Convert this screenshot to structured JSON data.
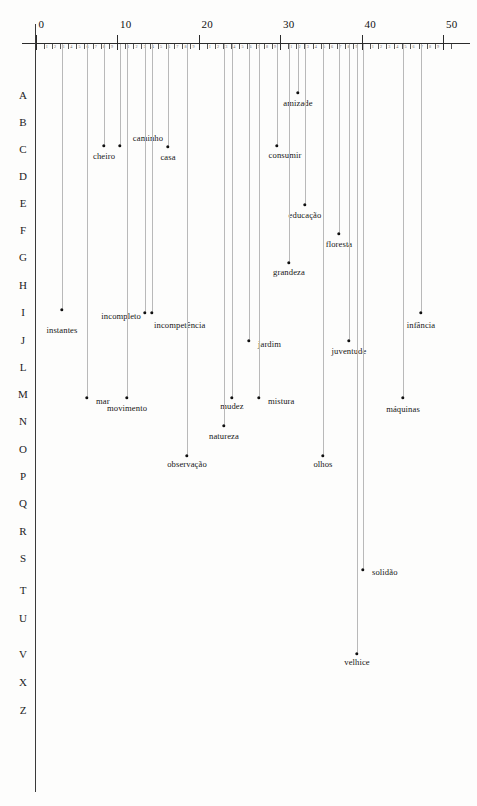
{
  "axis": {
    "major_ticks": [
      {
        "value": 0,
        "label": "0"
      },
      {
        "value": 10,
        "label": "10"
      },
      {
        "value": 20,
        "label": "20"
      },
      {
        "value": 30,
        "label": "30"
      },
      {
        "value": 40,
        "label": "40"
      },
      {
        "value": 50,
        "label": "50"
      }
    ],
    "minor_tick_labels": [
      "1",
      "2",
      "3",
      "4",
      "5",
      "6",
      "7",
      "8",
      "9"
    ],
    "range": [
      0,
      51
    ],
    "px_origin": 35.5,
    "px_per_unit": 8.15
  },
  "rows": [
    {
      "label": "A",
      "y": 95
    },
    {
      "label": "B",
      "y": 122
    },
    {
      "label": "C",
      "y": 149
    },
    {
      "label": "D",
      "y": 176
    },
    {
      "label": "E",
      "y": 203
    },
    {
      "label": "F",
      "y": 230
    },
    {
      "label": "G",
      "y": 257
    },
    {
      "label": "H",
      "y": 285
    },
    {
      "label": "I",
      "y": 312
    },
    {
      "label": "J",
      "y": 340
    },
    {
      "label": "L",
      "y": 367
    },
    {
      "label": "M",
      "y": 394
    },
    {
      "label": "N",
      "y": 421
    },
    {
      "label": "O",
      "y": 449
    },
    {
      "label": "P",
      "y": 476
    },
    {
      "label": "Q",
      "y": 503
    },
    {
      "label": "R",
      "y": 531
    },
    {
      "label": "S",
      "y": 558
    },
    {
      "label": "T",
      "y": 590
    },
    {
      "label": "U",
      "y": 618
    },
    {
      "label": "V",
      "y": 654
    },
    {
      "label": "X",
      "y": 682
    },
    {
      "label": "Z",
      "y": 710
    }
  ],
  "chart_data": {
    "type": "scatter",
    "title": "",
    "xlabel": "",
    "ylabel": "",
    "xlim": [
      0,
      51
    ],
    "grid": false,
    "legend": "none",
    "row_categories": [
      "A",
      "B",
      "C",
      "D",
      "E",
      "F",
      "G",
      "H",
      "I",
      "J",
      "L",
      "M",
      "N",
      "O",
      "P",
      "Q",
      "R",
      "S",
      "T",
      "U",
      "V",
      "X",
      "Z"
    ],
    "points": [
      {
        "label": "amizade",
        "x": 32.2,
        "row": "A",
        "px": 298,
        "py": 93,
        "lx": 298,
        "ly": 98,
        "pos": "below"
      },
      {
        "label": "cheiro",
        "x": 8.4,
        "row": "C",
        "px": 104,
        "py": 146,
        "lx": 104,
        "ly": 151,
        "pos": "below"
      },
      {
        "label": "caminho",
        "x": 10.4,
        "row": "C",
        "px": 120,
        "py": 146,
        "lx": 148,
        "ly": 133,
        "pos": "below"
      },
      {
        "label": "casa",
        "x": 16.3,
        "row": "C",
        "px": 168,
        "py": 147,
        "lx": 168,
        "ly": 152,
        "pos": "below"
      },
      {
        "label": "consumir",
        "x": 29.6,
        "row": "C",
        "px": 277,
        "py": 146,
        "lx": 285,
        "ly": 150,
        "pos": "below"
      },
      {
        "label": "educação",
        "x": 33.1,
        "row": "E",
        "px": 305,
        "py": 205,
        "lx": 305,
        "ly": 210,
        "pos": "below"
      },
      {
        "label": "floresta",
        "x": 37.2,
        "row": "F",
        "px": 339,
        "py": 234,
        "lx": 339,
        "ly": 239,
        "pos": "below"
      },
      {
        "label": "grandeza",
        "x": 31.1,
        "row": "G",
        "px": 289,
        "py": 263,
        "lx": 289,
        "ly": 267,
        "pos": "below"
      },
      {
        "label": "instantes",
        "x": 3.3,
        "row": "I",
        "px": 62,
        "py": 310,
        "lx": 62,
        "ly": 325,
        "pos": "below"
      },
      {
        "label": "incompleto",
        "x": 13.4,
        "row": "I",
        "px": 145,
        "py": 313,
        "lx": 141,
        "ly": 311,
        "pos": "left"
      },
      {
        "label": "incompetência",
        "x": 14.3,
        "row": "I",
        "px": 152,
        "py": 313,
        "lx": 150,
        "ly": 320,
        "pos": "right"
      },
      {
        "label": "infância",
        "x": 47.3,
        "row": "I",
        "px": 421,
        "py": 313,
        "lx": 421,
        "ly": 320,
        "pos": "below"
      },
      {
        "label": "jardim",
        "x": 26.2,
        "row": "J",
        "px": 249,
        "py": 341,
        "lx": 254,
        "ly": 339,
        "pos": "right"
      },
      {
        "label": "juventude",
        "x": 38.5,
        "row": "J",
        "px": 349,
        "py": 341,
        "lx": 349,
        "ly": 346,
        "pos": "below"
      },
      {
        "label": "mar",
        "x": 6.3,
        "row": "M",
        "px": 87,
        "py": 398,
        "lx": 92,
        "ly": 396,
        "pos": "right"
      },
      {
        "label": "movimento",
        "x": 11.2,
        "row": "M",
        "px": 127,
        "py": 398,
        "lx": 127,
        "ly": 403,
        "pos": "below"
      },
      {
        "label": "mudez",
        "x": 24.1,
        "row": "M",
        "px": 232,
        "py": 398,
        "lx": 232,
        "ly": 401,
        "pos": "below"
      },
      {
        "label": "mistura",
        "x": 27.4,
        "row": "M",
        "px": 259,
        "py": 398,
        "lx": 264,
        "ly": 396,
        "pos": "right"
      },
      {
        "label": "máquinas",
        "x": 45.0,
        "row": "M",
        "px": 403,
        "py": 398,
        "lx": 403,
        "ly": 404,
        "pos": "below"
      },
      {
        "label": "natureza",
        "x": 23.1,
        "row": "N",
        "px": 224,
        "py": 426,
        "lx": 224,
        "ly": 431,
        "pos": "below"
      },
      {
        "label": "observação",
        "x": 18.6,
        "row": "O",
        "px": 187,
        "py": 456,
        "lx": 187,
        "ly": 459,
        "pos": "below"
      },
      {
        "label": "olhos",
        "x": 35.3,
        "row": "O",
        "px": 323,
        "py": 456,
        "lx": 323,
        "ly": 459,
        "pos": "below"
      },
      {
        "label": "solidão",
        "x": 40.2,
        "row": "S",
        "px": 363,
        "py": 570,
        "lx": 368,
        "ly": 567,
        "pos": "right"
      },
      {
        "label": "velhice",
        "x": 39.4,
        "row": "V",
        "px": 357,
        "py": 654,
        "lx": 357,
        "ly": 657,
        "pos": "below"
      }
    ]
  }
}
